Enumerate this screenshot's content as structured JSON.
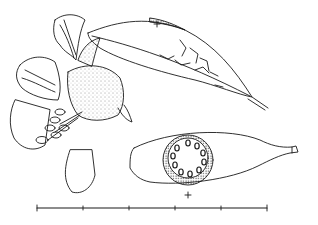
{
  "illustration": {
    "subject": "botanical line drawing",
    "parts": [
      "flower",
      "upper-leaf-bract",
      "seed-pod",
      "pod-cross-section"
    ],
    "ink_color": "#1a1a1a",
    "background": "#ffffff"
  },
  "scale_bar": {
    "x_start": 37,
    "x_end": 267,
    "y": 208,
    "ticks": [
      37,
      83,
      129,
      175,
      221,
      267
    ]
  },
  "markers": [
    {
      "name": "plus-marker-top",
      "x": 157,
      "y": 24
    },
    {
      "name": "plus-marker-bottom",
      "x": 188,
      "y": 195
    }
  ]
}
